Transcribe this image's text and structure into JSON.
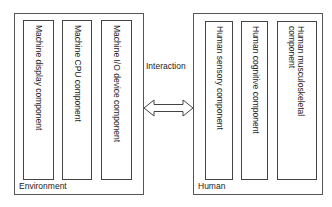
{
  "diagram": {
    "environment": {
      "label": "Environment",
      "components": [
        "Machine display component",
        "Machine CPU component",
        "Machine I/O device component"
      ]
    },
    "human": {
      "label": "Human",
      "components": [
        "Human sensory component",
        "Human cognitive component",
        "Human musculoskeletal component"
      ]
    },
    "interaction": {
      "label": "Interaction",
      "arrow": "double-headed-arrow"
    },
    "colors": {
      "line": "#444444",
      "text": "#222222",
      "background": "#ffffff"
    }
  }
}
